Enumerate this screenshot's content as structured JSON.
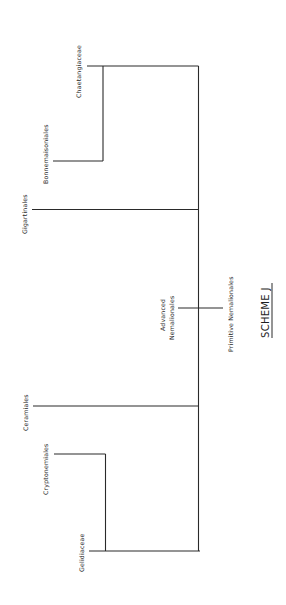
{
  "diagram": {
    "title": "SCHEME J",
    "orientation": "rotated 90° counter-clockwise",
    "taxa": {
      "chaetangiaceae": "Chaetangiaceae",
      "bonnemaisoniales": "Bonnemaisoniales",
      "gigartinales": "Gigartinales",
      "advanced_nemalionales_line1": "Advanced",
      "advanced_nemalionales_line2": "Nemalionales",
      "primitive_nemalionales": "Primitive  Nemalionales",
      "ceramiales": "Ceramiales",
      "cryptonemiales": "Cryptonemiales",
      "gelidiaceae": "Gelidiaceae"
    },
    "line_color": "#2a2a2a",
    "background": "#ffffff"
  }
}
